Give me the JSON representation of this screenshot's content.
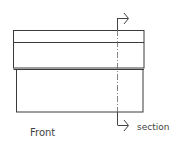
{
  "diagram": {
    "view_label": "Front",
    "section_label": "section",
    "colors": {
      "stroke": "#3a3a3a",
      "section_line": "#555555",
      "text": "#444444",
      "background": "#ffffff"
    },
    "shapes": {
      "upper_block": {
        "x": 13,
        "y": 30,
        "width": 131,
        "height": 38
      },
      "upper_divider_y": 42,
      "lower_block": {
        "x": 16,
        "y": 70,
        "width": 127,
        "height": 42
      },
      "section_line_x": 117
    }
  }
}
